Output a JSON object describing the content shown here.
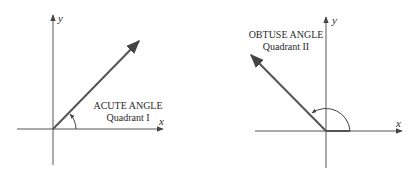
{
  "diagrams": [
    {
      "id": "acute",
      "title": "ACUTE ANGLE",
      "subtitle": "Quadrant I",
      "x_axis_label": "x",
      "y_axis_label": "y"
    },
    {
      "id": "obtuse",
      "title": "OBTUSE ANGLE",
      "subtitle": "Quadrant II",
      "x_axis_label": "x",
      "y_axis_label": "y"
    }
  ],
  "colors": {
    "axis": "#444444",
    "ray": "#555555",
    "text": "#2a2a2a"
  }
}
